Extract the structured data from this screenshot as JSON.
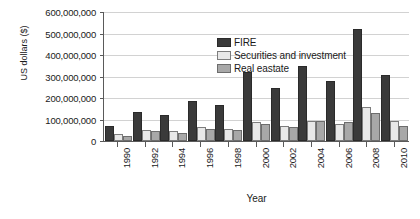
{
  "chart_data": {
    "type": "bar",
    "title": "",
    "xlabel": "Year",
    "ylabel": "US dollars ($)",
    "ylim": [
      0,
      600000000
    ],
    "yticks": [
      0,
      100000000,
      200000000,
      300000000,
      400000000,
      500000000,
      600000000
    ],
    "ytick_labels": [
      "0",
      "100,000,000",
      "200,000,000",
      "300,000,000",
      "400,000,000",
      "500,000,000",
      "600,000,000"
    ],
    "grid": true,
    "legend_position": "top-left-inside",
    "categories": [
      "1990",
      "1992",
      "1994",
      "1996",
      "1998",
      "2000",
      "2002",
      "2004",
      "2006",
      "2008",
      "2010"
    ],
    "series": [
      {
        "name": "FIRE",
        "color": "#3a3a3a",
        "values": [
          62000000,
          125000000,
          112000000,
          175000000,
          158000000,
          310000000,
          235000000,
          338000000,
          272000000,
          512000000,
          300000000
        ]
      },
      {
        "name": "Securities and investment",
        "color": "#e8e8e8",
        "values": [
          22000000,
          42000000,
          35000000,
          58000000,
          48000000,
          80000000,
          62000000,
          86000000,
          72000000,
          150000000,
          82000000
        ]
      },
      {
        "name": "Real eastate",
        "color": "#a8a8a8",
        "values": [
          14000000,
          35000000,
          28000000,
          48000000,
          42000000,
          70000000,
          58000000,
          82000000,
          78000000,
          122000000,
          62000000
        ]
      }
    ]
  }
}
